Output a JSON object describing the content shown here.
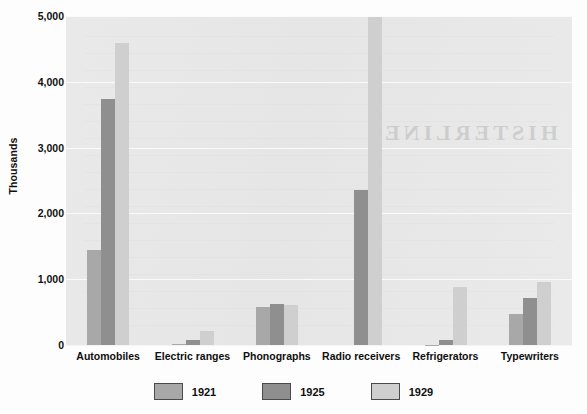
{
  "chart_data": {
    "type": "bar",
    "title": "",
    "subtitle": "",
    "xlabel": "",
    "ylabel": "Thousands",
    "ylim": [
      0,
      5000
    ],
    "yticks": [
      0,
      1000,
      2000,
      3000,
      4000,
      5000
    ],
    "ytick_labels": [
      "0",
      "1,000",
      "2,000",
      "3,000",
      "4,000",
      "5,000"
    ],
    "grid": true,
    "legend_position": "bottom",
    "categories": [
      "Automobiles",
      "Electric ranges",
      "Phonographs",
      "Radio receivers",
      "Refrigerators",
      "Typewriters"
    ],
    "series": [
      {
        "name": "1921",
        "color": "#a8a8a8",
        "values": [
          1440,
          20,
          580,
          0,
          5,
          470
        ]
      },
      {
        "name": "1925",
        "color": "#8f8f8f",
        "values": [
          3735,
          75,
          630,
          2350,
          75,
          720
        ]
      },
      {
        "name": "1929",
        "color": "#cfcfcf",
        "values": [
          4590,
          210,
          605,
          4980,
          880,
          960
        ]
      }
    ]
  },
  "watermark": {
    "main_text": "HISTERLINE"
  },
  "colors": {
    "plot_background": "#e6e6e6",
    "page_background": "#fdfdfd",
    "gridline": "#fafafa",
    "text": "#101010",
    "series_1921": "#a8a8a8",
    "series_1925": "#8f8f8f",
    "series_1929": "#cfcfcf"
  }
}
